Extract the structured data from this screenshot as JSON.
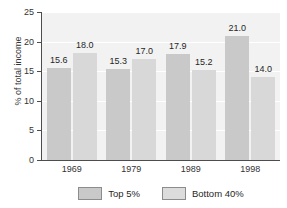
{
  "chart_data": {
    "type": "bar",
    "title": "",
    "subtitle": "",
    "xlabel": "",
    "ylabel": "% of total income",
    "categories": [
      "1969",
      "1979",
      "1989",
      "1998"
    ],
    "series": [
      {
        "name": "Top 5%",
        "values": [
          15.6,
          18.0,
          17.9,
          21.0
        ],
        "color": "#c9c9c9"
      },
      {
        "name": "Bottom 40%",
        "values": [
          15.6,
          17.0,
          15.2,
          14.0
        ],
        "color": "#d8d8d8"
      }
    ],
    "bars": [
      {
        "category": "1969",
        "series": "Top 5%",
        "value": 15.6,
        "label": "15.6"
      },
      {
        "category": "1969",
        "series": "Bottom 40%",
        "value": 18.0,
        "label": "18.0"
      },
      {
        "category": "1979",
        "series": "Top 5%",
        "value": 15.3,
        "label": "15.3"
      },
      {
        "category": "1979",
        "series": "Bottom 40%",
        "value": 17.0,
        "label": "17.0"
      },
      {
        "category": "1989",
        "series": "Top 5%",
        "value": 17.9,
        "label": "17.9"
      },
      {
        "category": "1989",
        "series": "Bottom 40%",
        "value": 15.2,
        "label": "15.2"
      },
      {
        "category": "1998",
        "series": "Top 5%",
        "value": 21.0,
        "label": "21.0"
      },
      {
        "category": "1998",
        "series": "Bottom 40%",
        "value": 14.0,
        "label": "14.0"
      }
    ],
    "ylim": [
      0,
      25
    ],
    "yticks": [
      0,
      5,
      10,
      15,
      20,
      25
    ],
    "ytick_labels": [
      "0",
      "5",
      "10",
      "15",
      "20",
      "25"
    ],
    "grid": true,
    "grid_color": "#ffffff",
    "plot_background": "#f2f2f2",
    "legend_position": "bottom",
    "legend": [
      {
        "label": "Top 5%",
        "color": "#c9c9c9"
      },
      {
        "label": "Bottom 40%",
        "color": "#dcdcdc"
      }
    ]
  }
}
